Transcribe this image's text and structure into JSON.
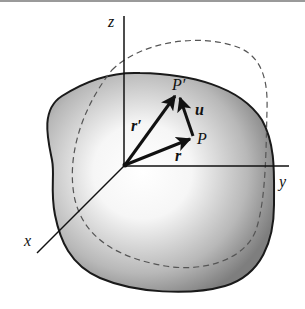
{
  "figure": {
    "labels": {
      "z_axis": "z",
      "y_axis": "y",
      "x_axis": "x",
      "point_P": "P",
      "point_P_prime": "P′",
      "vector_r": "r",
      "vector_r_prime": "r′",
      "vector_u": "u"
    },
    "colors": {
      "body_outline": "#1a1a1a",
      "body_shade_dark": "#7a7a7a",
      "body_shade_light": "#ffffff",
      "dashed_outline": "#555555",
      "vectors": "#111111"
    }
  }
}
